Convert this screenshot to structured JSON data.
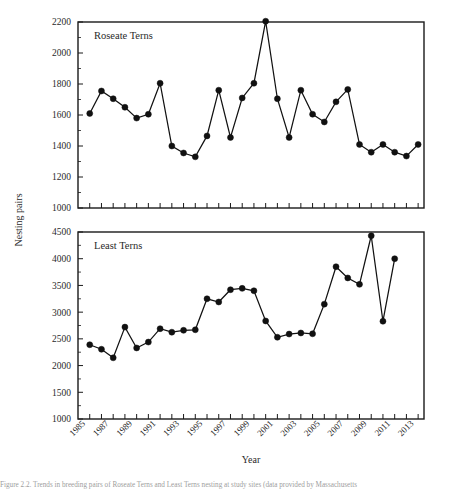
{
  "figure": {
    "axis_titles": {
      "x": "Year",
      "y": "Nesting pairs"
    },
    "caption": "Figure 2.2.  Trends in breeding pairs of Roseate Terns and Least Terns nesting at study sites (data provided by Massachusetts"
  },
  "chart_data": [
    {
      "type": "line",
      "title": "Roseate Terns",
      "panel": "top",
      "xlabel": "Year",
      "ylabel": "Nesting pairs",
      "xlim": [
        1984,
        2013.5
      ],
      "ylim": [
        1000,
        2200
      ],
      "yticks": [
        1000,
        1200,
        1400,
        1600,
        1800,
        2000,
        2200
      ],
      "grid": false,
      "legend": "none",
      "marker": "filled-circle",
      "x": [
        1985,
        1986,
        1987,
        1988,
        1989,
        1990,
        1991,
        1992,
        1993,
        1994,
        1995,
        1996,
        1997,
        1998,
        1999,
        2000,
        2001,
        2002,
        2003,
        2004,
        2005,
        2006,
        2007,
        2008,
        2009,
        2010,
        2011,
        2012,
        2013
      ],
      "values": [
        1610,
        1755,
        1705,
        1650,
        1580,
        1605,
        1805,
        1400,
        1355,
        1330,
        1465,
        1760,
        1455,
        1710,
        1805,
        2205,
        1705,
        1455,
        1760,
        1605,
        1555,
        1685,
        1765,
        1410,
        1360,
        1410,
        1360,
        1335,
        1410
      ]
    },
    {
      "type": "line",
      "title": "Least Terns",
      "panel": "bottom",
      "xlabel": "Year",
      "ylabel": "Nesting pairs",
      "xlim": [
        1984,
        2013.5
      ],
      "ylim": [
        1000,
        4500
      ],
      "yticks": [
        1000,
        1500,
        2000,
        2500,
        3000,
        3500,
        4000,
        4500
      ],
      "grid": false,
      "legend": "none",
      "marker": "filled-circle",
      "x": [
        1985,
        1986,
        1987,
        1988,
        1989,
        1990,
        1991,
        1992,
        1993,
        1994,
        1995,
        1996,
        1997,
        1998,
        1999,
        2000,
        2001,
        2002,
        2003,
        2004,
        2005,
        2006,
        2007,
        2008,
        2009,
        2010,
        2011,
        2012,
        2013
      ],
      "values": [
        2390,
        2305,
        2145,
        2720,
        2330,
        2440,
        2690,
        2625,
        2660,
        2670,
        3250,
        3190,
        3420,
        3445,
        3400,
        2835,
        2530,
        2590,
        2610,
        2595,
        3150,
        3850,
        3640,
        3520,
        4430,
        2830,
        4000,
        null,
        null
      ]
    }
  ],
  "xticklabels": [
    "1985",
    "1987",
    "1989",
    "1991",
    "1993",
    "1995",
    "1997",
    "1999",
    "2001",
    "2003",
    "2005",
    "2007",
    "2009",
    "2011",
    "2013"
  ]
}
